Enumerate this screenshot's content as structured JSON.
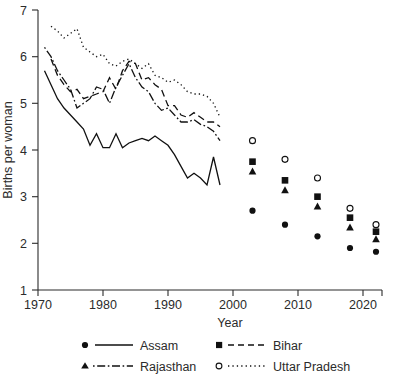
{
  "chart_data": {
    "type": "line",
    "title": "",
    "xlabel": "Year",
    "ylabel": "Births per woman",
    "xlim": [
      1970,
      2025
    ],
    "ylim": [
      1,
      7
    ],
    "xticks": [
      1970,
      1980,
      1990,
      2000,
      2010,
      2020
    ],
    "yticks": [
      1,
      2,
      3,
      4,
      5,
      6,
      7
    ],
    "grid": false,
    "legend_position": "below-axes",
    "series": [
      {
        "name": "Assam",
        "marker": "filled-circle",
        "linestyle": "solid",
        "color": "#111111",
        "line": {
          "x": [
            1971,
            1972,
            1973,
            1974,
            1975,
            1976,
            1977,
            1978,
            1979,
            1980,
            1981,
            1982,
            1983,
            1984,
            1985,
            1986,
            1987,
            1988,
            1989,
            1990,
            1991,
            1992,
            1993,
            1994,
            1995,
            1996,
            1997,
            1998
          ],
          "y": [
            5.7,
            5.4,
            5.1,
            4.9,
            4.75,
            4.6,
            4.45,
            4.1,
            4.35,
            4.05,
            4.05,
            4.35,
            4.05,
            4.15,
            4.2,
            4.25,
            4.2,
            4.3,
            4.2,
            4.1,
            3.9,
            3.65,
            3.4,
            3.5,
            3.4,
            3.25,
            3.85,
            3.25
          ]
        },
        "points": {
          "x": [
            2003,
            2008,
            2013,
            2018,
            2022
          ],
          "y": [
            2.7,
            2.4,
            2.15,
            1.9,
            1.82
          ]
        }
      },
      {
        "name": "Bihar",
        "marker": "filled-square",
        "linestyle": "dashed",
        "color": "#111111",
        "line": {
          "x": [
            1972,
            1973,
            1974,
            1975,
            1976,
            1977,
            1978,
            1979,
            1980,
            1981,
            1982,
            1983,
            1984,
            1985,
            1986,
            1987,
            1988,
            1989,
            1990,
            1991,
            1992,
            1993,
            1994,
            1995,
            1996,
            1997,
            1998
          ],
          "y": [
            5.95,
            5.6,
            5.4,
            5.25,
            5.3,
            5.1,
            5.15,
            5.2,
            5.25,
            5.55,
            5.3,
            5.7,
            5.9,
            5.85,
            5.5,
            5.55,
            5.4,
            5.3,
            4.95,
            4.95,
            4.75,
            4.7,
            4.8,
            4.7,
            4.6,
            4.6,
            4.5
          ]
        },
        "points": {
          "x": [
            2003,
            2008,
            2013,
            2018,
            2022
          ],
          "y": [
            3.75,
            3.35,
            3.0,
            2.55,
            2.25
          ]
        }
      },
      {
        "name": "Rajasthan",
        "marker": "filled-triangle",
        "linestyle": "dashdot",
        "color": "#111111",
        "line": {
          "x": [
            1971,
            1972,
            1973,
            1974,
            1975,
            1976,
            1977,
            1978,
            1979,
            1980,
            1981,
            1982,
            1983,
            1984,
            1985,
            1986,
            1987,
            1988,
            1989,
            1990,
            1991,
            1992,
            1993,
            1994,
            1995,
            1996,
            1997,
            1998
          ],
          "y": [
            6.2,
            6.0,
            5.7,
            5.5,
            5.3,
            4.9,
            5.0,
            5.1,
            5.35,
            5.3,
            5.0,
            5.35,
            5.6,
            5.85,
            5.55,
            5.35,
            5.25,
            5.0,
            4.85,
            4.9,
            4.75,
            4.6,
            4.6,
            4.65,
            4.55,
            4.5,
            4.4,
            4.2
          ]
        },
        "points": {
          "x": [
            2003,
            2008,
            2013,
            2018,
            2022
          ],
          "y": [
            3.55,
            3.15,
            2.8,
            2.35,
            2.1
          ]
        }
      },
      {
        "name": "Uttar Pradesh",
        "marker": "open-circle",
        "linestyle": "dotted",
        "color": "#111111",
        "line": {
          "x": [
            1972,
            1973,
            1974,
            1975,
            1976,
            1977,
            1978,
            1979,
            1980,
            1981,
            1982,
            1983,
            1984,
            1985,
            1986,
            1987,
            1988,
            1989,
            1990,
            1991,
            1992,
            1993,
            1994,
            1995,
            1996,
            1997,
            1998
          ],
          "y": [
            6.65,
            6.55,
            6.4,
            6.5,
            6.6,
            6.2,
            6.1,
            6.0,
            6.05,
            5.85,
            5.8,
            5.9,
            5.95,
            5.85,
            5.75,
            5.85,
            5.6,
            5.55,
            5.45,
            5.5,
            5.4,
            5.25,
            5.2,
            5.2,
            5.15,
            5.0,
            4.7
          ]
        },
        "points": {
          "x": [
            2003,
            2008,
            2013,
            2018,
            2022
          ],
          "y": [
            4.2,
            3.8,
            3.4,
            2.75,
            2.4
          ]
        }
      }
    ]
  },
  "axes": {
    "ylabel": "Births per woman",
    "xlabel": "Year",
    "xtick_labels": [
      "1970",
      "1980",
      "1990",
      "2000",
      "2010",
      "2020"
    ],
    "ytick_labels": [
      "1",
      "2",
      "3",
      "4",
      "5",
      "6",
      "7"
    ]
  },
  "legend": {
    "entries": [
      {
        "label": "Assam",
        "marker": "filled-circle",
        "linestyle": "solid"
      },
      {
        "label": "Bihar",
        "marker": "filled-square",
        "linestyle": "dashed"
      },
      {
        "label": "Rajasthan",
        "marker": "filled-triangle",
        "linestyle": "dashdot"
      },
      {
        "label": "Uttar Pradesh",
        "marker": "open-circle",
        "linestyle": "dotted"
      }
    ]
  },
  "caption": {
    "text": ""
  },
  "style": {
    "ink": "#111111",
    "axis": "#2b2b2b",
    "background": "#ffffff"
  }
}
